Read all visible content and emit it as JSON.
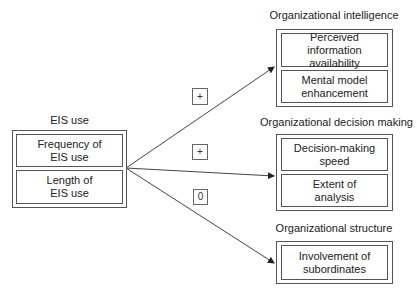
{
  "source": {
    "title": "EIS use",
    "items": [
      {
        "label": "Frequency of\nEIS use"
      },
      {
        "label": "Length of\nEIS use"
      }
    ]
  },
  "targets": [
    {
      "title": "Organizational intelligence",
      "items": [
        {
          "label": "Perceived information\navailability"
        },
        {
          "label": "Mental model\nenhancement"
        }
      ]
    },
    {
      "title": "Organizational decision making",
      "items": [
        {
          "label": "Decision-making\nspeed"
        },
        {
          "label": "Extent of\nanalysis"
        }
      ]
    },
    {
      "title": "Organizational structure",
      "items": [
        {
          "label": "Involvement of\nsubordinates"
        }
      ]
    }
  ],
  "relationships": [
    {
      "from": "EIS use",
      "to": "Organizational intelligence",
      "sign": "+"
    },
    {
      "from": "EIS use",
      "to": "Organizational decision making",
      "sign": "+"
    },
    {
      "from": "EIS use",
      "to": "Organizational structure",
      "sign": "0"
    }
  ],
  "colors": {
    "line": "#444444",
    "text": "#222222",
    "background": "#ffffff"
  }
}
